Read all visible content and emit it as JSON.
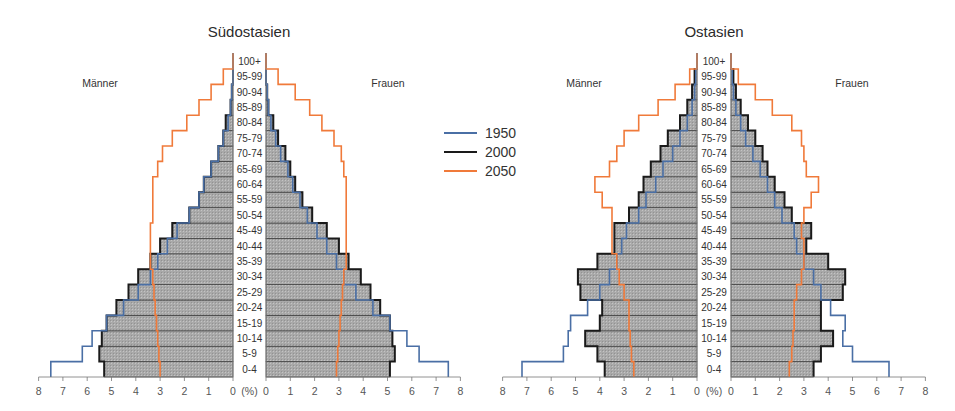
{
  "legend": [
    {
      "label": "1950",
      "color": "#4a6fa5"
    },
    {
      "label": "2000",
      "color": "#1a1a1a"
    },
    {
      "label": "2050",
      "color": "#f07a3a"
    }
  ],
  "axis_unit_label": "(%)",
  "age_groups": [
    "0-4",
    "5-9",
    "10-14",
    "15-19",
    "20-24",
    "25-29",
    "30-34",
    "35-39",
    "40-44",
    "45-49",
    "50-54",
    "55-59",
    "60-64",
    "65-69",
    "70-74",
    "75-79",
    "80-84",
    "85-89",
    "90-94",
    "95-99",
    "100+"
  ],
  "x_ticks": [
    "8",
    "7",
    "6",
    "5",
    "4",
    "3",
    "2",
    "1",
    "0"
  ],
  "chart_data": [
    {
      "type": "bar",
      "subtype": "population-pyramid",
      "title": "Südostasien",
      "left_label": "Männer",
      "right_label": "Frauen",
      "xlabel": "(%)",
      "xlim": [
        0,
        8
      ],
      "categories": [
        "0-4",
        "5-9",
        "10-14",
        "15-19",
        "20-24",
        "25-29",
        "30-34",
        "35-39",
        "40-44",
        "45-49",
        "50-54",
        "55-59",
        "60-64",
        "65-69",
        "70-74",
        "75-79",
        "80-84",
        "85-89",
        "90-94",
        "95-99",
        "100+"
      ],
      "series": [
        {
          "name": "1950",
          "side": "Männer",
          "values": [
            7.5,
            6.2,
            5.8,
            5.2,
            4.5,
            3.9,
            3.4,
            3.1,
            2.7,
            2.3,
            1.8,
            1.4,
            1.2,
            0.9,
            0.6,
            0.4,
            0.2,
            0.1,
            0.05,
            0.0,
            0.0
          ]
        },
        {
          "name": "1950",
          "side": "Frauen",
          "values": [
            7.5,
            6.3,
            5.8,
            5.1,
            4.4,
            3.7,
            3.2,
            2.9,
            2.5,
            2.1,
            1.7,
            1.4,
            1.1,
            0.9,
            0.6,
            0.4,
            0.2,
            0.1,
            0.05,
            0.0,
            0.0
          ]
        },
        {
          "name": "2000",
          "side": "Männer",
          "values": [
            5.3,
            5.5,
            5.4,
            5.2,
            4.8,
            4.3,
            3.9,
            3.4,
            3.0,
            2.5,
            1.8,
            1.4,
            1.2,
            0.9,
            0.6,
            0.4,
            0.3,
            0.1,
            0.05,
            0.0,
            0.0
          ]
        },
        {
          "name": "2000",
          "side": "Frauen",
          "values": [
            5.1,
            5.3,
            5.2,
            5.1,
            4.7,
            4.3,
            3.9,
            3.4,
            3.0,
            2.5,
            1.9,
            1.5,
            1.2,
            1.0,
            0.8,
            0.5,
            0.3,
            0.1,
            0.05,
            0.0,
            0.0
          ]
        },
        {
          "name": "2050",
          "side": "Männer",
          "values": [
            3.0,
            3.05,
            3.1,
            3.15,
            3.2,
            3.25,
            3.3,
            3.4,
            3.4,
            3.4,
            3.3,
            3.3,
            3.3,
            3.1,
            2.9,
            2.5,
            1.9,
            1.4,
            0.9,
            0.4,
            0.0
          ]
        },
        {
          "name": "2050",
          "side": "Frauen",
          "values": [
            2.9,
            2.95,
            3.0,
            3.05,
            3.1,
            3.15,
            3.2,
            3.3,
            3.3,
            3.3,
            3.3,
            3.3,
            3.3,
            3.2,
            3.1,
            2.8,
            2.3,
            1.8,
            1.2,
            0.5,
            0.0
          ]
        }
      ]
    },
    {
      "type": "bar",
      "subtype": "population-pyramid",
      "title": "Ostasien",
      "left_label": "Männer",
      "right_label": "Frauen",
      "xlabel": "(%)",
      "xlim": [
        0,
        8
      ],
      "categories": [
        "0-4",
        "5-9",
        "10-14",
        "15-19",
        "20-24",
        "25-29",
        "30-34",
        "35-39",
        "40-44",
        "45-49",
        "50-54",
        "55-59",
        "60-64",
        "65-69",
        "70-74",
        "75-79",
        "80-84",
        "85-89",
        "90-94",
        "95-99",
        "100+"
      ],
      "series": [
        {
          "name": "1950",
          "side": "Männer",
          "values": [
            7.2,
            5.5,
            5.3,
            5.2,
            4.5,
            4.0,
            3.6,
            3.3,
            3.1,
            2.9,
            2.4,
            2.1,
            1.7,
            1.4,
            1.0,
            0.7,
            0.4,
            0.2,
            0.1,
            0.05,
            0.0
          ]
        },
        {
          "name": "1950",
          "side": "Frauen",
          "values": [
            6.5,
            5.0,
            4.6,
            4.7,
            4.1,
            3.7,
            3.4,
            3.0,
            2.7,
            2.6,
            2.1,
            1.8,
            1.5,
            1.2,
            0.9,
            0.6,
            0.4,
            0.2,
            0.1,
            0.05,
            0.0
          ]
        },
        {
          "name": "2000",
          "side": "Männer",
          "values": [
            3.8,
            4.1,
            4.6,
            4.0,
            3.9,
            4.8,
            4.9,
            4.1,
            3.4,
            3.4,
            2.8,
            2.4,
            2.2,
            1.9,
            1.5,
            1.2,
            0.7,
            0.4,
            0.2,
            0.1,
            0.0
          ]
        },
        {
          "name": "2000",
          "side": "Frauen",
          "values": [
            3.4,
            3.7,
            4.2,
            3.7,
            3.7,
            4.6,
            4.7,
            4.0,
            3.1,
            3.3,
            2.5,
            2.2,
            1.8,
            1.5,
            1.3,
            1.0,
            0.7,
            0.4,
            0.2,
            0.1,
            0.0
          ]
        },
        {
          "name": "2050",
          "side": "Männer",
          "values": [
            2.6,
            2.7,
            2.75,
            2.8,
            2.8,
            3.0,
            3.2,
            3.3,
            3.5,
            3.5,
            3.5,
            3.9,
            4.2,
            3.6,
            3.3,
            3.0,
            2.4,
            1.6,
            0.9,
            0.3,
            0.0
          ]
        },
        {
          "name": "2050",
          "side": "Frauen",
          "values": [
            2.4,
            2.5,
            2.55,
            2.6,
            2.6,
            2.7,
            2.9,
            3.0,
            3.0,
            2.9,
            3.0,
            3.3,
            3.6,
            3.1,
            3.0,
            2.9,
            2.5,
            1.7,
            1.0,
            0.3,
            0.0
          ]
        }
      ]
    }
  ]
}
